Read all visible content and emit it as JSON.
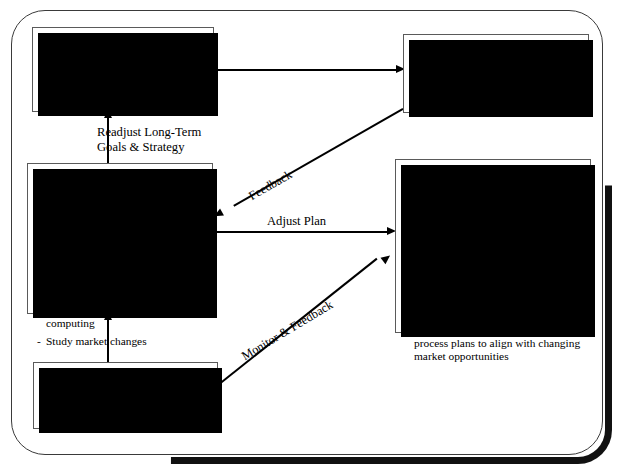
{
  "diagram": {
    "frame": {
      "style": "rounded-rectangle-with-shadow"
    }
  },
  "boxes": {
    "long_term": {
      "title": "Long-Term\nPlanning Process",
      "bullets": [
        "Establish strategic plans aligned with organizational goals"
      ]
    },
    "initial_deployment": {
      "title": "",
      "bullets": [
        "Initial Client/Server deployment"
      ]
    },
    "mid_term": {
      "title": "Mid-Term\nPlanning Process",
      "bullets": [
        "Evaluate performance",
        "Zero in on the most successful Client/Server experiences",
        "Analyze obstacles & disappointments",
        "Identify unexpected benefits & opportunities of Client/Server computing",
        "Study market changes"
      ]
    },
    "actions": {
      "title": "",
      "bullets": [
        "Eliminate as many causes of obstacles and disappointments as possible",
        "Modify Client/Server plans to better align with strategic organizational goals",
        "Clarify & modify vision",
        "Improve business process to gain benefits only realized during initial Client/Server deployment",
        "Modify Client/Server & business process plans to align with changing market opportunities"
      ]
    },
    "annual": {
      "title": "Annual\nPlanning Process",
      "bullets": [
        "Go to Mid-Term Process Planning"
      ]
    }
  },
  "arrows": {
    "long_term_to_initial": {
      "label": "",
      "direction": "right"
    },
    "readjust": {
      "label": "Readjust Long-Term\nGoals & Strategy",
      "direction": "up"
    },
    "feedback": {
      "label": "Feedback",
      "direction": "down-left"
    },
    "adjust_plan": {
      "label": "Adjust Plan",
      "direction": "right"
    },
    "monitor_feedback": {
      "label": "Monitor & Feedback",
      "direction": "up-right"
    },
    "annual_to_mid_term": {
      "label": "",
      "direction": "up"
    }
  },
  "colors": {
    "line": "#000000",
    "box_border": "#5a5a5a",
    "box_fill": "#ffffff",
    "shadow": "#000000",
    "frame": "#3a3a3a"
  }
}
